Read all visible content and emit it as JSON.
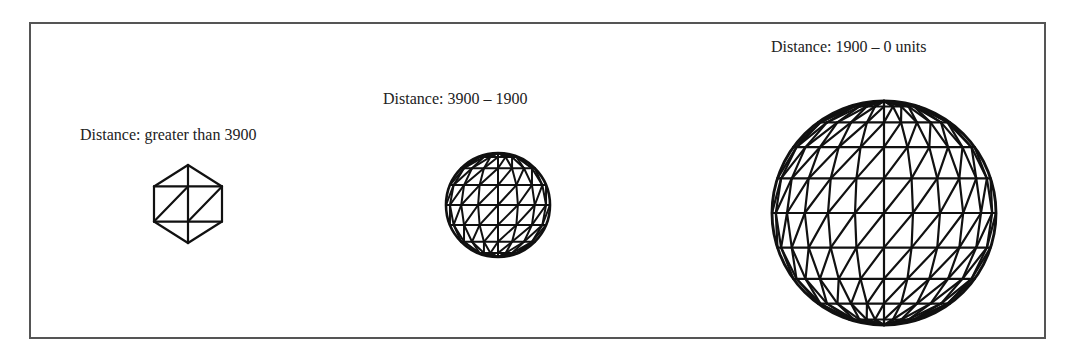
{
  "figure": {
    "panels": [
      {
        "id": "low",
        "label": "Distance: greater than 3900",
        "label_pos": {
          "x": 80,
          "y": 127
        },
        "mesh": {
          "type": "hexagon",
          "cx": 188,
          "cy": 204,
          "rx": 34,
          "ry": 39,
          "stroke": 2.2
        }
      },
      {
        "id": "mid",
        "label": "Distance: 3900 – 1900",
        "label_pos": {
          "x": 383,
          "y": 91
        },
        "mesh": {
          "type": "sphere",
          "cx": 498,
          "cy": 205,
          "r": 52,
          "lat": 8,
          "lon": 8,
          "stroke": 2.0
        }
      },
      {
        "id": "high",
        "label": "Distance: 1900 – 0 units",
        "label_pos": {
          "x": 771,
          "y": 39
        },
        "mesh": {
          "type": "sphere",
          "cx": 884,
          "cy": 213,
          "r": 112,
          "lat": 10,
          "lon": 12,
          "stroke": 2.2
        }
      }
    ],
    "colors": {
      "stroke": "#111111",
      "frame": "#555555",
      "text": "#222222"
    }
  }
}
